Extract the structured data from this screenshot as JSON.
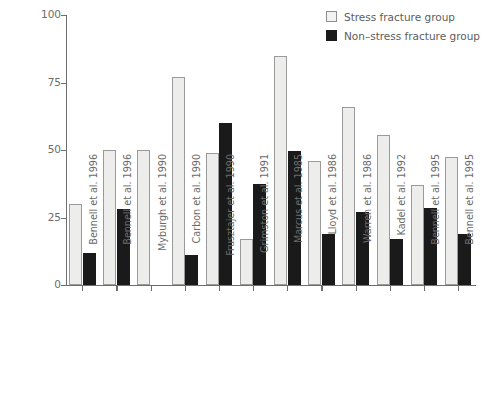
{
  "chart_data": {
    "type": "bar",
    "title": "",
    "xlabel": "",
    "ylabel": "% of athletes with menstrual irregularity",
    "ylim": [
      0,
      100
    ],
    "yticks": [
      "0",
      "25",
      "50",
      "75",
      "100"
    ],
    "grid": false,
    "legend_position": "top-right",
    "categories": [
      "Bennell et al. 1996",
      "Bennell et al. 1996",
      "Myburgh et al. 1990",
      "Carbon et al. 1990",
      "Frusztajer et al. 1990",
      "Grimston et al. 1991",
      "Marcus et al. 1985",
      "Lloyd et al. 1986",
      "Warren et al. 1986",
      "Kadel et al. 1992",
      "Bennell et al. 1995",
      "Bennell et al. 1995"
    ],
    "series": [
      {
        "name": "Stress fracture group",
        "color": "#ededeb",
        "values": [
          30,
          50,
          50,
          77,
          49,
          17,
          85,
          46,
          66,
          55.5,
          37,
          47.5
        ]
      },
      {
        "name": "Non–stress fracture group",
        "color": "#1a1a1a",
        "values": [
          12,
          28,
          null,
          11,
          60,
          37.5,
          49.5,
          19,
          27,
          17,
          28.5,
          19
        ]
      }
    ]
  },
  "legend": {
    "items": [
      {
        "label": "Stress fracture group",
        "swatch": "light"
      },
      {
        "label": "Non–stress fracture group",
        "swatch": "dark"
      }
    ]
  },
  "axes": {
    "y_title": "% of athletes with menstrual irregularity"
  }
}
